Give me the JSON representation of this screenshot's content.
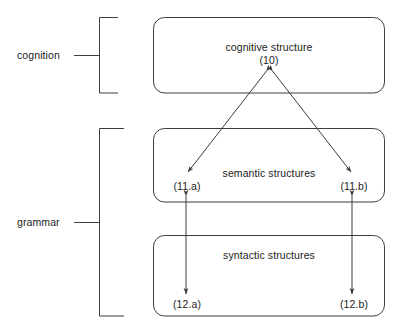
{
  "diagram": {
    "stroke_color": "#3d3d3d",
    "text_color": "#1c1c1c",
    "background_color": "#ffffff",
    "brackets": [
      {
        "label": "cognition",
        "name": "cognition"
      },
      {
        "label": "grammar",
        "name": "grammar"
      }
    ],
    "boxes": [
      {
        "name": "cognitive-structure",
        "title": "cognitive structure",
        "ref": "(10)"
      },
      {
        "name": "semantic-structures",
        "title": "semantic structures"
      },
      {
        "name": "syntactic-structures",
        "title": "syntactic structures"
      }
    ],
    "nodes": [
      {
        "name": "node-11a",
        "label": "(11.a)"
      },
      {
        "name": "node-11b",
        "label": "(11.b)"
      },
      {
        "name": "node-12a",
        "label": "(12.a)"
      },
      {
        "name": "node-12b",
        "label": "(12.b)"
      }
    ],
    "connections": [
      {
        "name": "arrow-10-to-11a",
        "from": "(10)",
        "to": "(11.a)",
        "style": "double-headed-diagonal"
      },
      {
        "name": "arrow-10-to-11b",
        "from": "(10)",
        "to": "(11.b)",
        "style": "double-headed-diagonal"
      },
      {
        "name": "arrow-11a-to-12a",
        "from": "(11.a)",
        "to": "(12.a)",
        "style": "double-headed-vertical"
      },
      {
        "name": "arrow-11b-to-12b",
        "from": "(11.b)",
        "to": "(12.b)",
        "style": "double-headed-vertical"
      }
    ]
  }
}
